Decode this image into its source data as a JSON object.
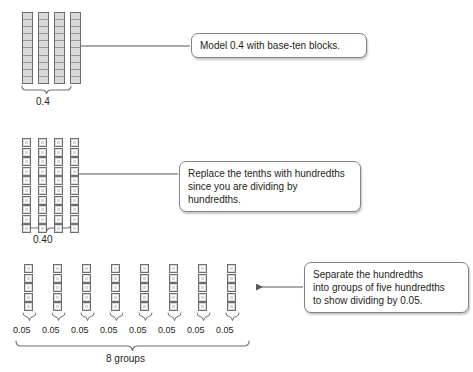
{
  "figure": {
    "line_color": "#58595b",
    "block_fill": "#d9d9d9",
    "block_stroke": "#6d6e71",
    "background": "#ffffff"
  },
  "steps": [
    {
      "id": "step-1",
      "model": {
        "type": "tenths-rods",
        "columns": 4,
        "cells_per_column": 10,
        "total_value": 0.4
      },
      "bracket_label": "0.4",
      "callout": "Model 0.4 with base-ten blocks."
    },
    {
      "id": "step-2",
      "model": {
        "type": "hundredths-units",
        "columns": 4,
        "cells_per_column": 10,
        "total_value": 0.4
      },
      "bracket_label": "0.40",
      "callout": "Replace the tenths with hundredths\nsince you are dividing by hundredths."
    },
    {
      "id": "step-3",
      "model": {
        "type": "hundredths-groups",
        "groups": 8,
        "cells_per_group": 5,
        "group_value": 0.05
      },
      "group_labels": [
        "0.05",
        "0.05",
        "0.05",
        "0.05",
        "0.05",
        "0.05",
        "0.05",
        "0.05"
      ],
      "bracket_label": "8 groups",
      "callout": "Separate the hundredths\ninto groups of five hundredths\nto show dividing by 0.05."
    }
  ]
}
